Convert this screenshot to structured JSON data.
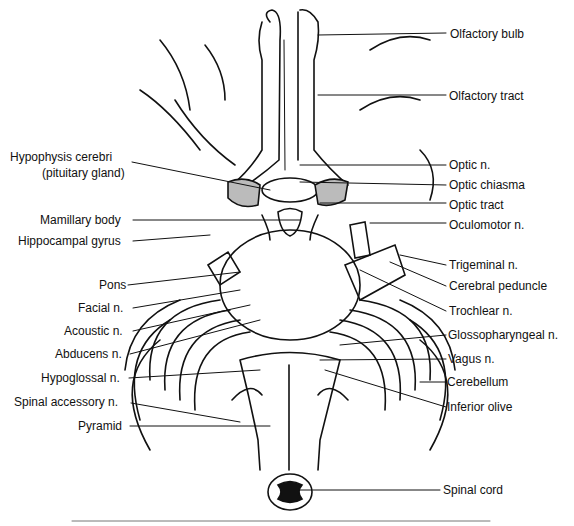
{
  "figure": {
    "labels_left": [
      {
        "id": "hypophysis",
        "text": "Hypophysis cerebri",
        "x": 10,
        "y": 150
      },
      {
        "id": "pituitary",
        "text": "(pituitary gland)",
        "x": 42,
        "y": 166
      },
      {
        "id": "mamillary",
        "text": "Mamillary body",
        "x": 40,
        "y": 213
      },
      {
        "id": "hippocampal",
        "text": "Hippocampal gyrus",
        "x": 18,
        "y": 234
      },
      {
        "id": "pons",
        "text": "Pons",
        "x": 99,
        "y": 278
      },
      {
        "id": "facial",
        "text": "Facial n.",
        "x": 78,
        "y": 301
      },
      {
        "id": "acoustic",
        "text": "Acoustic n.",
        "x": 64,
        "y": 324
      },
      {
        "id": "abducens",
        "text": "Abducens n.",
        "x": 55,
        "y": 347
      },
      {
        "id": "hypoglossal",
        "text": "Hypoglossal n.",
        "x": 41,
        "y": 371
      },
      {
        "id": "spinal-accessory",
        "text": "Spinal accessory n.",
        "x": 14,
        "y": 395
      },
      {
        "id": "pyramid",
        "text": "Pyramid",
        "x": 78,
        "y": 419
      }
    ],
    "labels_right": [
      {
        "id": "olfactory-bulb",
        "text": "Olfactory bulb",
        "x": 450,
        "y": 27
      },
      {
        "id": "olfactory-tract",
        "text": "Olfactory tract",
        "x": 449,
        "y": 89
      },
      {
        "id": "optic-n",
        "text": "Optic n.",
        "x": 449,
        "y": 158
      },
      {
        "id": "optic-chiasma",
        "text": "Optic chiasma",
        "x": 449,
        "y": 178
      },
      {
        "id": "optic-tract",
        "text": "Optic tract",
        "x": 449,
        "y": 198
      },
      {
        "id": "oculomotor",
        "text": "Oculomotor n.",
        "x": 449,
        "y": 218
      },
      {
        "id": "trigeminal",
        "text": "Trigeminal n.",
        "x": 449,
        "y": 258
      },
      {
        "id": "cerebral-peduncle",
        "text": "Cerebral peduncle",
        "x": 449,
        "y": 279
      },
      {
        "id": "trochlear",
        "text": "Trochlear n.",
        "x": 449,
        "y": 304
      },
      {
        "id": "glossopharyngeal",
        "text": "Glossopharyngeal n.",
        "x": 448,
        "y": 328
      },
      {
        "id": "vagus",
        "text": "Vagus n.",
        "x": 448,
        "y": 352
      },
      {
        "id": "cerebellum",
        "text": "Cerebellum",
        "x": 447,
        "y": 375
      },
      {
        "id": "inferior-olive",
        "text": "Inferior olive",
        "x": 447,
        "y": 400
      },
      {
        "id": "spinal-cord",
        "text": "Spinal cord",
        "x": 443,
        "y": 483
      }
    ]
  }
}
